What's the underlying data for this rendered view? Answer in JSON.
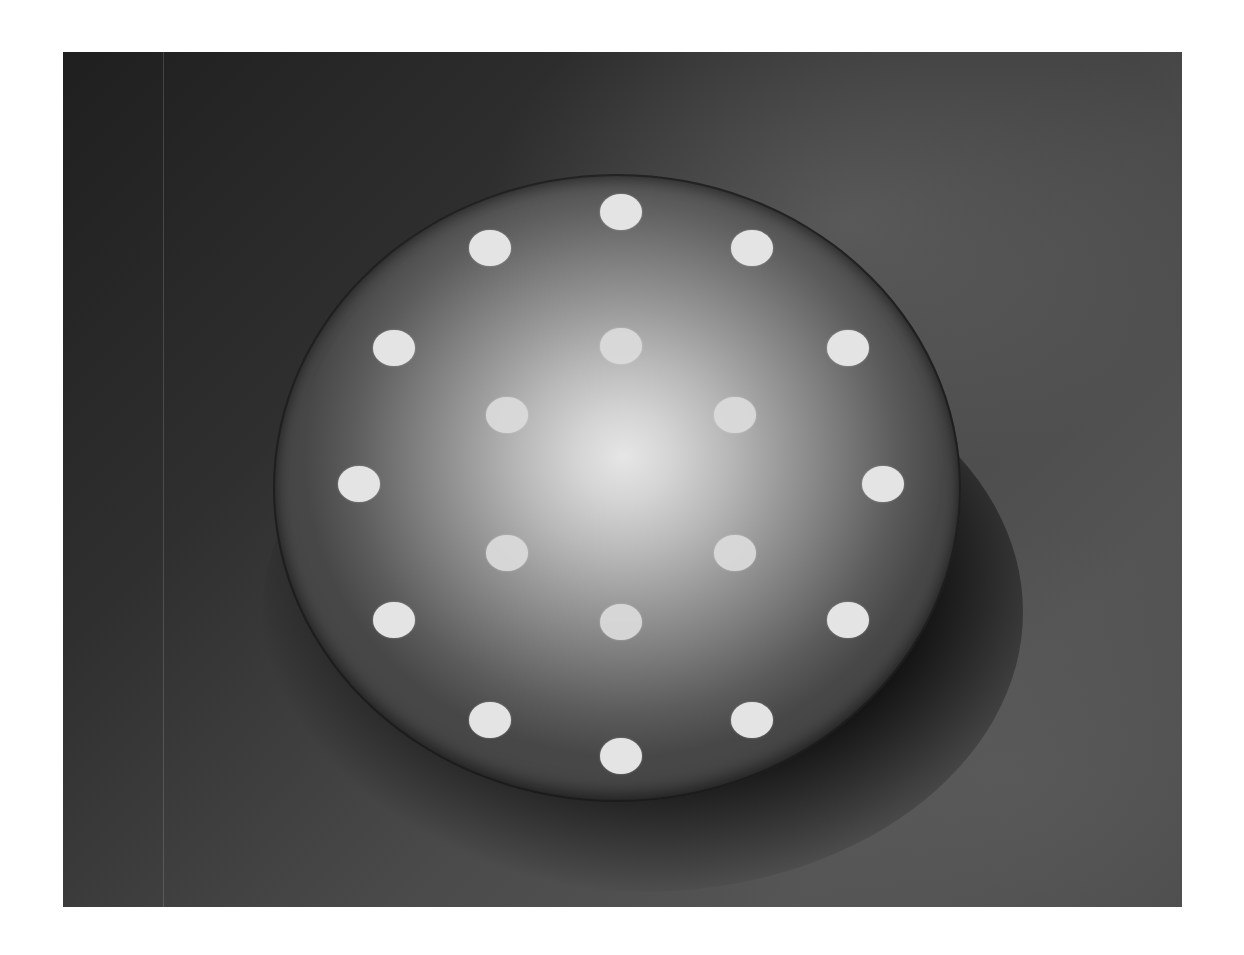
{
  "image": {
    "description": "Black-and-white photograph of a domed disc with light dots arranged in two concentric rings",
    "alt_text": "Domed disc with 12 outer dots and 6 inner dots"
  },
  "dome": {
    "outer_ring_dot_count": 12,
    "inner_ring_dot_count": 6,
    "colors": {
      "background_dark": "#1f1f1f",
      "background_light": "#545454",
      "dome_highlight": "#e6e6e6",
      "dome_edge": "#474747",
      "dot": "#e4e4e4"
    }
  }
}
